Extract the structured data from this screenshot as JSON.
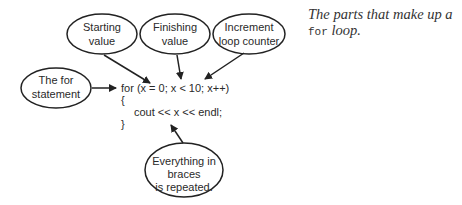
{
  "bubbles": {
    "starting": {
      "line1": "Starting",
      "line2": "value"
    },
    "finishing": {
      "line1": "Finishing",
      "line2": "value"
    },
    "increment": {
      "line1": "Increment",
      "line2": "loop counter"
    },
    "for_statement": {
      "line1": "The for",
      "line2": "statement"
    },
    "braces": {
      "line1": "Everything in",
      "line2": "braces",
      "line3": "is repeated."
    }
  },
  "code": {
    "line1": "for (x = 0; x < 10; x++)",
    "line2": "{",
    "line3": "cout << x << endl;",
    "line4": "}"
  },
  "caption": {
    "text": "The parts that make up a",
    "keyword": "for",
    "suffix": " loop."
  },
  "colors": {
    "stroke": "#222222",
    "text": "#2a2a2a"
  }
}
